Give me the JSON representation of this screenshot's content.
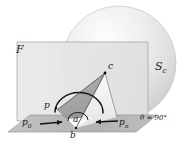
{
  "figure": {
    "background_color": "#ffffff",
    "labels": {
      "plane": "F",
      "sphere": "S",
      "sphere_sub": "c",
      "apex": "c",
      "point_p": "p",
      "point_p0": "p",
      "point_p0_sub": "0",
      "point_ppi": "p",
      "point_ppi_sub": "π",
      "point_a": "a",
      "point_b": "b",
      "angle": "θ = 90°"
    },
    "colors": {
      "sphere_light": "#f6f6f6",
      "sphere_mid": "#dcdcdc",
      "sphere_dark": "#c6c6c6",
      "plane_face": "#e3e3e3",
      "ground_face": "#b9b9b9",
      "cone_dark": "#9a9a9a",
      "cone_light": "#f2f2f2",
      "ink": "#1b1b1b"
    },
    "geometry": {
      "sphere_center_x": 119,
      "sphere_center_y": 63,
      "sphere_radius": 57,
      "apex_x": 105,
      "apex_y": 73,
      "point_p_x": 56,
      "point_p_y": 108,
      "point_b_x": 76,
      "point_b_y": 128,
      "point_a_x": 79,
      "point_a_y": 118
    }
  }
}
